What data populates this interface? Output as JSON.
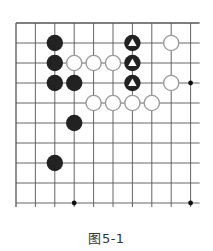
{
  "diagram": {
    "type": "go-board-fragment",
    "caption": "图5-1",
    "grid": {
      "origin_x": 16,
      "origin_y": 23,
      "spacing_x": 19.4,
      "spacing_y": 20,
      "cols": 10,
      "rows": 10,
      "right_edge_open": true,
      "bottom_edge_open": true,
      "line_color": "#555555"
    },
    "stones": {
      "black": [
        [
          2,
          1
        ],
        [
          2,
          2
        ],
        [
          2,
          3
        ],
        [
          3,
          3
        ],
        [
          3,
          5
        ],
        [
          2,
          7
        ]
      ],
      "black_marked_triangle": [
        [
          6,
          1
        ],
        [
          6,
          2
        ],
        [
          6,
          3
        ]
      ],
      "white": [
        [
          8,
          1
        ],
        [
          3,
          2
        ],
        [
          4,
          2
        ],
        [
          5,
          2
        ],
        [
          8,
          3
        ],
        [
          4,
          4
        ],
        [
          5,
          4
        ],
        [
          6,
          4
        ],
        [
          7,
          4
        ]
      ]
    },
    "star_points": [
      [
        9,
        3
      ],
      [
        3,
        9
      ],
      [
        9,
        9
      ]
    ],
    "colors": {
      "black_stone": "#222222",
      "white_stone_fill": "#ffffff",
      "white_stone_stroke": "#999999",
      "triangle": "#ffffff"
    }
  }
}
